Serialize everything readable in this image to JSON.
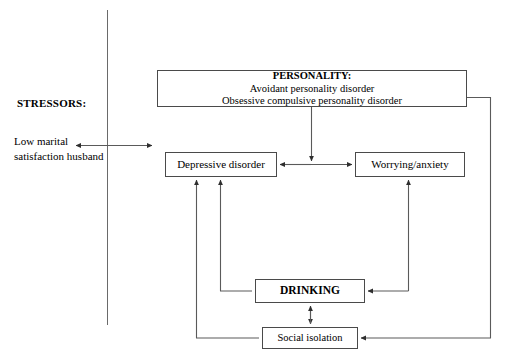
{
  "diagram": {
    "line_color": "#4a4a4a",
    "text_color": "#000000",
    "background": "#ffffff",
    "divider": {
      "name": "vertical-divider",
      "x": 107,
      "y_top": 10,
      "y_bottom": 325
    },
    "labels": {
      "stressors": "STRESSORS:",
      "low_marital_line1": "Low marital",
      "low_marital_line2": "satisfaction husband"
    },
    "nodes": {
      "personality": {
        "heading": "PERSONALITY:",
        "line2": "Avoidant personality disorder",
        "line3": "Obsessive compulsive personality disorder"
      },
      "depressive": {
        "label": "Depressive disorder"
      },
      "worrying": {
        "label": "Worrying/anxiety"
      },
      "drinking": {
        "label": "DRINKING"
      },
      "social": {
        "label": "Social isolation"
      }
    },
    "edges": [
      {
        "name": "edge-stressors-bidirectional",
        "from": "Low marital satisfaction husband",
        "to": "diagram domain",
        "arrows": "both",
        "orientation": "horizontal"
      },
      {
        "name": "edge-personality-to-middle",
        "from": "PERSONALITY:",
        "to": "Depressive disorder / Worrying/anxiety link",
        "arrows": "end",
        "orientation": "vertical"
      },
      {
        "name": "edge-depressive-worrying",
        "from": "Depressive disorder",
        "to": "Worrying/anxiety",
        "arrows": "both",
        "orientation": "horizontal"
      },
      {
        "name": "edge-personality-to-social",
        "from": "PERSONALITY:",
        "to": "Social isolation",
        "arrows": "end",
        "orientation": "elbow-right"
      },
      {
        "name": "edge-drinking-to-worrying",
        "from": "DRINKING",
        "to": "Worrying/anxiety",
        "arrows": "end",
        "orientation": "elbow-right"
      },
      {
        "name": "edge-worrying-to-drinking",
        "from": "Worrying/anxiety",
        "to": "DRINKING",
        "arrows": "end",
        "orientation": "elbow-right"
      },
      {
        "name": "edge-drinking-to-depressive",
        "from": "DRINKING",
        "to": "Depressive disorder",
        "arrows": "end",
        "orientation": "elbow-left"
      },
      {
        "name": "edge-social-to-depressive",
        "from": "Social isolation",
        "to": "Depressive disorder",
        "arrows": "end",
        "orientation": "elbow-left"
      },
      {
        "name": "edge-drinking-social",
        "from": "DRINKING",
        "to": "Social isolation",
        "arrows": "both",
        "orientation": "vertical"
      }
    ]
  }
}
